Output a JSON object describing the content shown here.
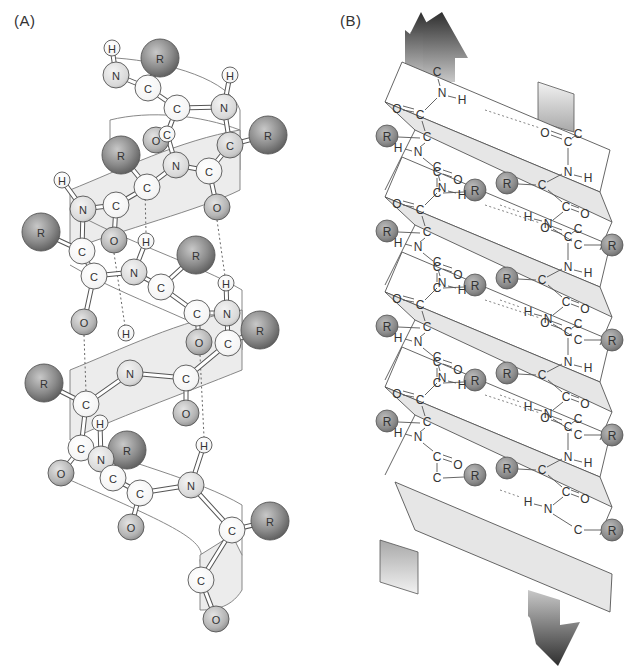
{
  "figure": {
    "panel_a": {
      "label": "(A)",
      "title": "alpha helix",
      "atoms": [
        {
          "el": "H",
          "x": 112,
          "y": 48,
          "r": 8,
          "kind": "h"
        },
        {
          "el": "R",
          "x": 160,
          "y": 58,
          "r": 19,
          "kind": "r"
        },
        {
          "el": "N",
          "x": 116,
          "y": 75,
          "r": 13,
          "kind": "n"
        },
        {
          "el": "C",
          "x": 148,
          "y": 88,
          "r": 13,
          "kind": "c"
        },
        {
          "el": "C",
          "x": 177,
          "y": 108,
          "r": 13,
          "kind": "c"
        },
        {
          "el": "H",
          "x": 230,
          "y": 75,
          "r": 8,
          "kind": "h"
        },
        {
          "el": "N",
          "x": 224,
          "y": 107,
          "r": 13,
          "kind": "n"
        },
        {
          "el": "O",
          "x": 156,
          "y": 140,
          "r": 13,
          "kind": "o"
        },
        {
          "el": "C",
          "x": 167,
          "y": 134,
          "r": 8,
          "kind": "c"
        },
        {
          "el": "R",
          "x": 268,
          "y": 135,
          "r": 19,
          "kind": "r"
        },
        {
          "el": "C",
          "x": 230,
          "y": 145,
          "r": 13,
          "kind": "cs"
        },
        {
          "el": "R",
          "x": 121,
          "y": 155,
          "r": 19,
          "kind": "r"
        },
        {
          "el": "N",
          "x": 176,
          "y": 165,
          "r": 13,
          "kind": "n"
        },
        {
          "el": "C",
          "x": 209,
          "y": 171,
          "r": 13,
          "kind": "c"
        },
        {
          "el": "C",
          "x": 147,
          "y": 187,
          "r": 13,
          "kind": "c"
        },
        {
          "el": "H",
          "x": 62,
          "y": 180,
          "r": 8,
          "kind": "h"
        },
        {
          "el": "C",
          "x": 116,
          "y": 205,
          "r": 13,
          "kind": "c"
        },
        {
          "el": "N",
          "x": 83,
          "y": 209,
          "r": 13,
          "kind": "n"
        },
        {
          "el": "O",
          "x": 217,
          "y": 207,
          "r": 13,
          "kind": "o"
        },
        {
          "el": "R",
          "x": 41,
          "y": 232,
          "r": 19,
          "kind": "r"
        },
        {
          "el": "O",
          "x": 114,
          "y": 240,
          "r": 13,
          "kind": "o"
        },
        {
          "el": "H",
          "x": 146,
          "y": 241,
          "r": 8,
          "kind": "h"
        },
        {
          "el": "C",
          "x": 82,
          "y": 251,
          "r": 13,
          "kind": "c"
        },
        {
          "el": "R",
          "x": 196,
          "y": 255,
          "r": 19,
          "kind": "r"
        },
        {
          "el": "C",
          "x": 94,
          "y": 276,
          "r": 13,
          "kind": "c"
        },
        {
          "el": "N",
          "x": 134,
          "y": 272,
          "r": 13,
          "kind": "n"
        },
        {
          "el": "C",
          "x": 161,
          "y": 287,
          "r": 13,
          "kind": "c"
        },
        {
          "el": "H",
          "x": 226,
          "y": 283,
          "r": 8,
          "kind": "h"
        },
        {
          "el": "C",
          "x": 197,
          "y": 313,
          "r": 13,
          "kind": "c"
        },
        {
          "el": "N",
          "x": 227,
          "y": 313,
          "r": 13,
          "kind": "n"
        },
        {
          "el": "R",
          "x": 260,
          "y": 330,
          "r": 19,
          "kind": "r"
        },
        {
          "el": "O",
          "x": 84,
          "y": 322,
          "r": 13,
          "kind": "o"
        },
        {
          "el": "O",
          "x": 199,
          "y": 342,
          "r": 13,
          "kind": "o"
        },
        {
          "el": "C",
          "x": 228,
          "y": 343,
          "r": 13,
          "kind": "c"
        },
        {
          "el": "H",
          "x": 126,
          "y": 333,
          "r": 8,
          "kind": "h"
        },
        {
          "el": "R",
          "x": 44,
          "y": 383,
          "r": 19,
          "kind": "r"
        },
        {
          "el": "N",
          "x": 130,
          "y": 373,
          "r": 13,
          "kind": "n"
        },
        {
          "el": "C",
          "x": 186,
          "y": 378,
          "r": 13,
          "kind": "c"
        },
        {
          "el": "C",
          "x": 86,
          "y": 404,
          "r": 13,
          "kind": "c"
        },
        {
          "el": "O",
          "x": 186,
          "y": 413,
          "r": 13,
          "kind": "o"
        },
        {
          "el": "H",
          "x": 100,
          "y": 423,
          "r": 8,
          "kind": "h"
        },
        {
          "el": "H",
          "x": 204,
          "y": 445,
          "r": 8,
          "kind": "h"
        },
        {
          "el": "C",
          "x": 81,
          "y": 448,
          "r": 13,
          "kind": "c"
        },
        {
          "el": "R",
          "x": 127,
          "y": 450,
          "r": 19,
          "kind": "r"
        },
        {
          "el": "N",
          "x": 101,
          "y": 459,
          "r": 13,
          "kind": "n"
        },
        {
          "el": "O",
          "x": 61,
          "y": 473,
          "r": 13,
          "kind": "o"
        },
        {
          "el": "C",
          "x": 113,
          "y": 478,
          "r": 13,
          "kind": "c"
        },
        {
          "el": "C",
          "x": 140,
          "y": 493,
          "r": 13,
          "kind": "c"
        },
        {
          "el": "N",
          "x": 191,
          "y": 485,
          "r": 13,
          "kind": "n"
        },
        {
          "el": "O",
          "x": 131,
          "y": 527,
          "r": 13,
          "kind": "o"
        },
        {
          "el": "C",
          "x": 232,
          "y": 530,
          "r": 13,
          "kind": "c"
        },
        {
          "el": "R",
          "x": 270,
          "y": 521,
          "r": 19,
          "kind": "r"
        },
        {
          "el": "C",
          "x": 201,
          "y": 580,
          "r": 13,
          "kind": "c"
        },
        {
          "el": "O",
          "x": 216,
          "y": 619,
          "r": 13,
          "kind": "o"
        }
      ],
      "bonds": [
        [
          0,
          2
        ],
        [
          2,
          3
        ],
        [
          3,
          1
        ],
        [
          3,
          4
        ],
        [
          4,
          6
        ],
        [
          6,
          5
        ],
        [
          4,
          8
        ],
        [
          8,
          12
        ],
        [
          6,
          10
        ],
        [
          10,
          9
        ],
        [
          10,
          13
        ],
        [
          12,
          13
        ],
        [
          12,
          14
        ],
        [
          14,
          11
        ],
        [
          13,
          18
        ],
        [
          14,
          16
        ],
        [
          16,
          17
        ],
        [
          17,
          15
        ],
        [
          16,
          20
        ],
        [
          17,
          22
        ],
        [
          22,
          19
        ],
        [
          22,
          24
        ],
        [
          24,
          25
        ],
        [
          25,
          21
        ],
        [
          25,
          26
        ],
        [
          26,
          23
        ],
        [
          26,
          28
        ],
        [
          28,
          29
        ],
        [
          29,
          27
        ],
        [
          28,
          32
        ],
        [
          29,
          33
        ],
        [
          33,
          30
        ],
        [
          33,
          37
        ],
        [
          24,
          31
        ],
        [
          37,
          36
        ],
        [
          36,
          38
        ],
        [
          38,
          35
        ],
        [
          37,
          39
        ],
        [
          38,
          42
        ],
        [
          42,
          45
        ],
        [
          42,
          44
        ],
        [
          44,
          40
        ],
        [
          44,
          46
        ],
        [
          46,
          47
        ],
        [
          47,
          48
        ],
        [
          48,
          41
        ],
        [
          47,
          49
        ],
        [
          48,
          50
        ],
        [
          50,
          51
        ],
        [
          50,
          52
        ],
        [
          52,
          53
        ]
      ],
      "hbonds": [
        [
          [
            145,
            190
          ],
          [
            146,
            233
          ]
        ],
        [
          [
            217,
            220
          ],
          [
            225,
            276
          ]
        ],
        [
          [
            114,
            253
          ],
          [
            125,
            326
          ]
        ],
        [
          [
            84,
            335
          ],
          [
            86,
            392
          ]
        ],
        [
          [
            200,
            355
          ],
          [
            204,
            437
          ]
        ]
      ]
    },
    "panel_b": {
      "label": "(B)",
      "title": "beta sheet",
      "top_arrow_color": "#3a3a3a",
      "bottom_arrow_color": "#3a3a3a",
      "strands": [
        {
          "y": 0
        },
        {
          "y": 95
        },
        {
          "y": 190
        },
        {
          "y": 285
        },
        {
          "y": 380
        }
      ],
      "left_chain_labels": [
        "C",
        "N",
        "H",
        "O",
        "C",
        "C",
        "H",
        "N",
        "C",
        "O",
        "C",
        "R",
        "R"
      ],
      "right_chain_labels": [
        "O",
        "C",
        "C",
        "N",
        "H",
        "C",
        "R",
        "R",
        "C",
        "O",
        "H",
        "N"
      ]
    }
  }
}
